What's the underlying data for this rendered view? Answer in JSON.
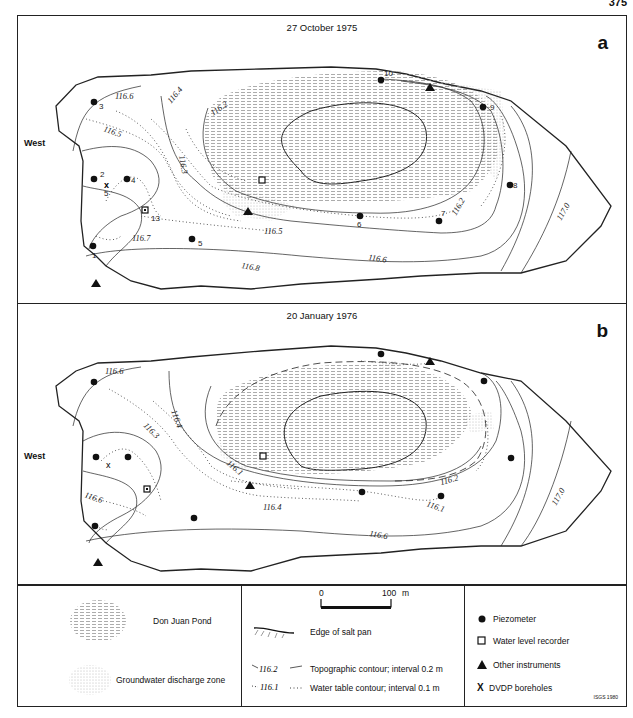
{
  "page_number": "375",
  "panels": [
    {
      "id": "a",
      "date": "27 October 1975",
      "letter": "a",
      "west_label": "West",
      "topographic_contours": [
        "116.6",
        "116.4",
        "116.2",
        "116.8",
        "116.6",
        "116.2",
        "117.0"
      ],
      "water_table_contours": [
        "116.5",
        "116.3",
        "116.7",
        "116.5"
      ],
      "piezometers": [
        "1",
        "2",
        "3",
        "4",
        "5",
        "6",
        "7",
        "8",
        "9",
        "10"
      ],
      "borehole": {
        "label": "5"
      },
      "recorder_label": "13"
    },
    {
      "id": "b",
      "date": "20 January 1976",
      "letter": "b",
      "west_label": "West",
      "topographic_contours": [
        "116.6",
        "116.4",
        "116.2",
        "116.6",
        "117.0"
      ],
      "water_table_contours": [
        "116.3",
        "116.1",
        "116.4",
        "116.6",
        "116.1"
      ]
    }
  ],
  "legend": {
    "pond": "Don Juan Pond",
    "discharge": "Groundwater discharge zone",
    "scale": {
      "start": "0",
      "end": "100",
      "unit": "m"
    },
    "edge": "Edge of salt pan",
    "topo_sample": "116.2",
    "topo": "Topographic contour; interval 0.2 m",
    "water_sample": "116.1",
    "water": "Water table contour; interval 0.1 m",
    "piezometer": "Piezometer",
    "recorder": "Water level recorder",
    "instruments": "Other instruments",
    "borehole_symbol": "X",
    "borehole": "DVDP boreholes",
    "credit": "ISGS 1980"
  }
}
